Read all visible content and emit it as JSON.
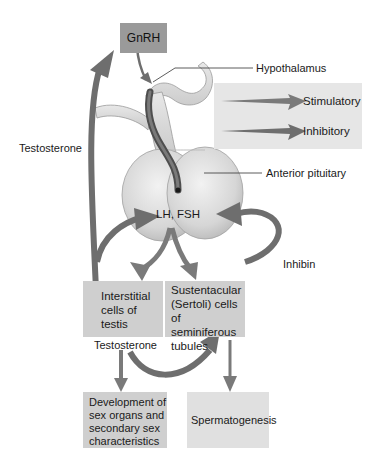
{
  "diagram": {
    "nodes": {
      "gnrh": "GnRH",
      "hypothalamus": "Hypothalamus",
      "anterior_pituitary": "Anterior pituitary",
      "lh_fsh": "LH, FSH",
      "interstitial": [
        "Interstitial",
        "cells of",
        "testis"
      ],
      "sertoli": [
        "Sustentacular",
        "(Sertoli) cells",
        "of seminiferous",
        "tubules"
      ],
      "development": [
        "Development of",
        "sex organs and",
        "secondary sex",
        "characteristics"
      ],
      "spermatogenesis": "Spermatogenesis"
    },
    "edge_labels": {
      "testosterone_feedback": "Testosterone",
      "testosterone_output": "Testosterone",
      "inhibin": "Inhibin"
    },
    "legend": {
      "stimulatory": "Stimulatory",
      "inhibitory": "Inhibitory"
    },
    "colors": {
      "stimulatory_arrow": "#7a7a7a",
      "inhibitory_arrow": "#6e6e6e",
      "box_fill": "#cfcfcf",
      "gnrh_fill": "#9a9a9a",
      "legend_fill": "#e6e6e6",
      "pituitary_fill": "#dedede",
      "portal_vessel": "#555555"
    }
  }
}
